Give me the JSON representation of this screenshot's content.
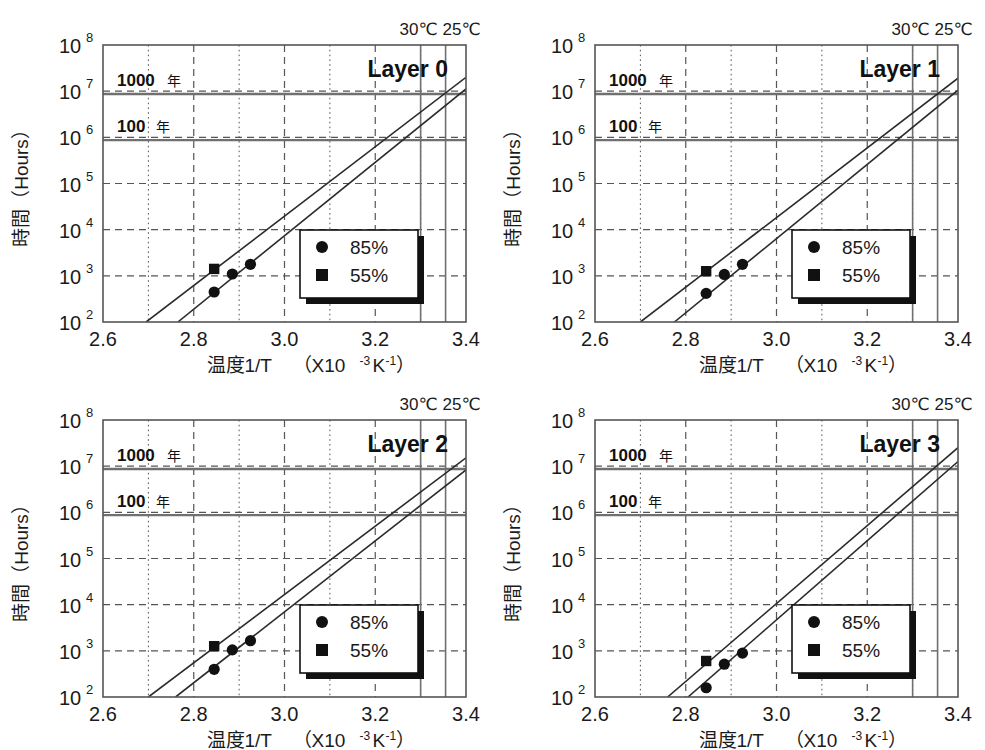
{
  "figure": {
    "panel_count": 4,
    "background": "#ffffff",
    "line_color": "#2b2b2b",
    "grid_color": "#555555",
    "marker_color": "#111111"
  },
  "chart_data": [
    {
      "type": "scatter",
      "title": "Layer 0",
      "xlabel": "温度1/T （X10-3K-1）",
      "xlabel_main": "温度1/T",
      "xlabel_unit_open": "（X10",
      "xlabel_unit_sup1": "-3",
      "xlabel_unit_mid": "K",
      "xlabel_unit_sup2": "-1",
      "xlabel_unit_close": "）",
      "ylabel": "時間（Hours）",
      "xlim": [
        2.6,
        3.4
      ],
      "ylim": [
        2,
        8
      ],
      "y_is_log": true,
      "xticks": [
        "2.6",
        "2.8",
        "3.0",
        "3.2",
        "3.4"
      ],
      "xtick_values": [
        2.6,
        2.8,
        3.0,
        3.2,
        3.4
      ],
      "yticks": [
        "10^2",
        "10^3",
        "10^4",
        "10^5",
        "10^6",
        "10^7",
        "10^8"
      ],
      "ytick_exponents": [
        2,
        3,
        4,
        5,
        6,
        7,
        8
      ],
      "grid": "major-dashed-minor-dotted",
      "legend_position": "lower-right",
      "legend": [
        {
          "label": "85%",
          "marker": "circle"
        },
        {
          "label": "55%",
          "marker": "square"
        }
      ],
      "reference_lines_horizontal": [
        {
          "label_number": "1000",
          "label_unit": "年",
          "y_log": 6.94
        },
        {
          "label_number": "100",
          "label_unit": "年",
          "y_log": 5.94
        }
      ],
      "reference_lines_vertical": [
        {
          "label": "30℃",
          "x": 3.3
        },
        {
          "label": "25℃",
          "x": 3.355
        }
      ],
      "series": [
        {
          "name": "85%",
          "marker": "circle",
          "points": [
            {
              "x": 2.845,
              "y_log": 2.65
            },
            {
              "x": 2.885,
              "y_log": 3.04
            },
            {
              "x": 2.925,
              "y_log": 3.25
            }
          ],
          "fit_line": {
            "x1": 2.765,
            "y1_log": 2.0,
            "x2": 3.4,
            "y2_log": 7.05
          }
        },
        {
          "name": "55%",
          "marker": "square",
          "points": [
            {
              "x": 2.845,
              "y_log": 3.15
            }
          ],
          "fit_line": {
            "x1": 2.695,
            "y1_log": 2.0,
            "x2": 3.4,
            "y2_log": 7.3
          }
        }
      ]
    },
    {
      "type": "scatter",
      "title": "Layer 1",
      "xlabel": "温度1/T （X10-3K-1）",
      "xlabel_main": "温度1/T",
      "xlabel_unit_open": "（X10",
      "xlabel_unit_sup1": "-3",
      "xlabel_unit_mid": "K",
      "xlabel_unit_sup2": "-1",
      "xlabel_unit_close": "）",
      "ylabel": "時間（Hours）",
      "xlim": [
        2.6,
        3.4
      ],
      "ylim": [
        2,
        8
      ],
      "y_is_log": true,
      "xticks": [
        "2.6",
        "2.8",
        "3.0",
        "3.2",
        "3.4"
      ],
      "xtick_values": [
        2.6,
        2.8,
        3.0,
        3.2,
        3.4
      ],
      "yticks": [
        "10^2",
        "10^3",
        "10^4",
        "10^5",
        "10^6",
        "10^7",
        "10^8"
      ],
      "ytick_exponents": [
        2,
        3,
        4,
        5,
        6,
        7,
        8
      ],
      "grid": "major-dashed-minor-dotted",
      "legend_position": "lower-right",
      "legend": [
        {
          "label": "85%",
          "marker": "circle"
        },
        {
          "label": "55%",
          "marker": "square"
        }
      ],
      "reference_lines_horizontal": [
        {
          "label_number": "1000",
          "label_unit": "年",
          "y_log": 6.94
        },
        {
          "label_number": "100",
          "label_unit": "年",
          "y_log": 5.94
        }
      ],
      "reference_lines_vertical": [
        {
          "label": "30℃",
          "x": 3.3
        },
        {
          "label": "25℃",
          "x": 3.355
        }
      ],
      "series": [
        {
          "name": "85%",
          "marker": "circle",
          "points": [
            {
              "x": 2.845,
              "y_log": 2.62
            },
            {
              "x": 2.885,
              "y_log": 3.03
            },
            {
              "x": 2.925,
              "y_log": 3.25
            }
          ],
          "fit_line": {
            "x1": 2.775,
            "y1_log": 2.0,
            "x2": 3.4,
            "y2_log": 7.02
          }
        },
        {
          "name": "55%",
          "marker": "square",
          "points": [
            {
              "x": 2.845,
              "y_log": 3.1
            }
          ],
          "fit_line": {
            "x1": 2.7,
            "y1_log": 2.0,
            "x2": 3.4,
            "y2_log": 7.28
          }
        }
      ]
    },
    {
      "type": "scatter",
      "title": "Layer 2",
      "xlabel": "温度1/T （X10-3K-1）",
      "xlabel_main": "温度1/T",
      "xlabel_unit_open": "（X10",
      "xlabel_unit_sup1": "-3",
      "xlabel_unit_mid": "K",
      "xlabel_unit_sup2": "-1",
      "xlabel_unit_close": "）",
      "ylabel": "時間（Hours）",
      "xlim": [
        2.6,
        3.4
      ],
      "ylim": [
        2,
        8
      ],
      "y_is_log": true,
      "xticks": [
        "2.6",
        "2.8",
        "3.0",
        "3.2",
        "3.4"
      ],
      "xtick_values": [
        2.6,
        2.8,
        3.0,
        3.2,
        3.4
      ],
      "yticks": [
        "10^2",
        "10^3",
        "10^4",
        "10^5",
        "10^6",
        "10^7",
        "10^8"
      ],
      "ytick_exponents": [
        2,
        3,
        4,
        5,
        6,
        7,
        8
      ],
      "grid": "major-dashed-minor-dotted",
      "legend_position": "lower-right",
      "legend": [
        {
          "label": "85%",
          "marker": "circle"
        },
        {
          "label": "55%",
          "marker": "square"
        }
      ],
      "reference_lines_horizontal": [
        {
          "label_number": "1000",
          "label_unit": "年",
          "y_log": 6.94
        },
        {
          "label_number": "100",
          "label_unit": "年",
          "y_log": 5.94
        }
      ],
      "reference_lines_vertical": [
        {
          "label": "30℃",
          "x": 3.3
        },
        {
          "label": "25℃",
          "x": 3.355
        }
      ],
      "series": [
        {
          "name": "85%",
          "marker": "circle",
          "points": [
            {
              "x": 2.845,
              "y_log": 2.6
            },
            {
              "x": 2.885,
              "y_log": 3.02
            },
            {
              "x": 2.925,
              "y_log": 3.22
            }
          ],
          "fit_line": {
            "x1": 2.76,
            "y1_log": 2.0,
            "x2": 3.4,
            "y2_log": 6.92
          }
        },
        {
          "name": "55%",
          "marker": "square",
          "points": [
            {
              "x": 2.845,
              "y_log": 3.1
            }
          ],
          "fit_line": {
            "x1": 2.7,
            "y1_log": 2.0,
            "x2": 3.4,
            "y2_log": 7.18
          }
        }
      ]
    },
    {
      "type": "scatter",
      "title": "Layer 3",
      "xlabel": "温度1/T （X10-3K-1）",
      "xlabel_main": "温度1/T",
      "xlabel_unit_open": "（X10",
      "xlabel_unit_sup1": "-3",
      "xlabel_unit_mid": "K",
      "xlabel_unit_sup2": "-1",
      "xlabel_unit_close": "）",
      "ylabel": "時間（Hours）",
      "xlim": [
        2.6,
        3.4
      ],
      "ylim": [
        2,
        8
      ],
      "y_is_log": true,
      "xticks": [
        "2.6",
        "2.8",
        "3.0",
        "3.2",
        "3.4"
      ],
      "xtick_values": [
        2.6,
        2.8,
        3.0,
        3.2,
        3.4
      ],
      "yticks": [
        "10^2",
        "10^3",
        "10^4",
        "10^5",
        "10^6",
        "10^7",
        "10^8"
      ],
      "ytick_exponents": [
        2,
        3,
        4,
        5,
        6,
        7,
        8
      ],
      "grid": "major-dashed-minor-dotted",
      "legend_position": "lower-right",
      "legend": [
        {
          "label": "85%",
          "marker": "circle"
        },
        {
          "label": "55%",
          "marker": "square"
        }
      ],
      "reference_lines_horizontal": [
        {
          "label_number": "1000",
          "label_unit": "年",
          "y_log": 6.94
        },
        {
          "label_number": "100",
          "label_unit": "年",
          "y_log": 5.94
        }
      ],
      "reference_lines_vertical": [
        {
          "label": "30℃",
          "x": 3.3
        },
        {
          "label": "25℃",
          "x": 3.355
        }
      ],
      "series": [
        {
          "name": "85%",
          "marker": "circle",
          "points": [
            {
              "x": 2.845,
              "y_log": 2.2
            },
            {
              "x": 2.885,
              "y_log": 2.71
            },
            {
              "x": 2.925,
              "y_log": 2.95
            }
          ],
          "fit_line": {
            "x1": 2.805,
            "y1_log": 2.0,
            "x2": 3.4,
            "y2_log": 7.1
          }
        },
        {
          "name": "55%",
          "marker": "square",
          "points": [
            {
              "x": 2.845,
              "y_log": 2.78
            }
          ],
          "fit_line": {
            "x1": 2.76,
            "y1_log": 2.0,
            "x2": 3.4,
            "y2_log": 7.4
          }
        }
      ]
    }
  ]
}
